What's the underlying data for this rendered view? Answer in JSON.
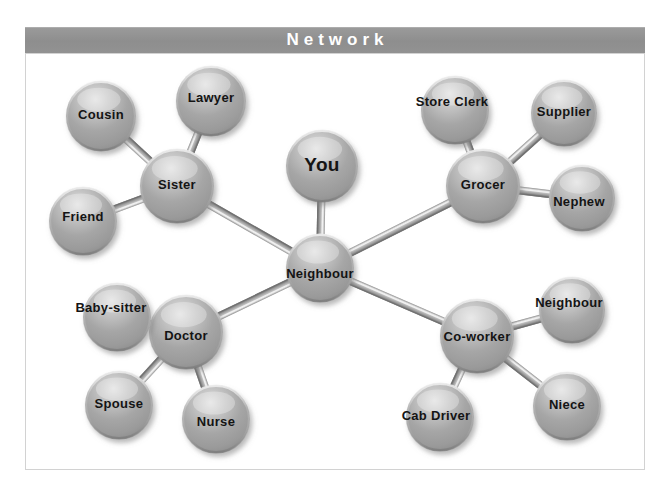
{
  "title": {
    "text": "Network"
  },
  "colors": {
    "title_band": "#919191",
    "title_text": "#ffffff",
    "frame_border": "#d2d2d2",
    "page_background": "#ffffff",
    "node_fill": "#a2a2a2",
    "node_highlight": "#d8d8d8",
    "node_shadow": "#6d6d6d",
    "node_label": "#141414",
    "edge_light": "#cfcfcf",
    "edge_dark": "#8a8a8a"
  },
  "chart_data": {
    "type": "diagram",
    "title": "Network",
    "layout": "node-link graph",
    "nodes": [
      {
        "id": "you",
        "label": "You",
        "x": 322,
        "y": 166,
        "r": 36,
        "font": 19,
        "label_dx": 0,
        "label_dy": 0
      },
      {
        "id": "neighbour_hub",
        "label": "Neighbour",
        "x": 320,
        "y": 268,
        "r": 34,
        "font": 13,
        "label_dx": 0,
        "label_dy": 7
      },
      {
        "id": "sister",
        "label": "Sister",
        "x": 177,
        "y": 186,
        "r": 37,
        "font": 13,
        "label_dx": 0,
        "label_dy": 0
      },
      {
        "id": "grocer",
        "label": "Grocer",
        "x": 483,
        "y": 186,
        "r": 37,
        "font": 13,
        "label_dx": 0,
        "label_dy": 0
      },
      {
        "id": "doctor",
        "label": "Doctor",
        "x": 186,
        "y": 332,
        "r": 37,
        "font": 13,
        "label_dx": 0,
        "label_dy": 5
      },
      {
        "id": "co_worker",
        "label": "Co-worker",
        "x": 477,
        "y": 336,
        "r": 37,
        "font": 13,
        "label_dx": 0,
        "label_dy": 2
      },
      {
        "id": "cousin",
        "label": "Cousin",
        "x": 101,
        "y": 116,
        "r": 35,
        "font": 13,
        "label_dx": 0,
        "label_dy": 0
      },
      {
        "id": "lawyer",
        "label": "Lawyer",
        "x": 211,
        "y": 101,
        "r": 35,
        "font": 13,
        "label_dx": 0,
        "label_dy": -2
      },
      {
        "id": "friend",
        "label": "Friend",
        "x": 83,
        "y": 221,
        "r": 34,
        "font": 13,
        "label_dx": 0,
        "label_dy": -3
      },
      {
        "id": "store_clerk",
        "label": "Store Clerk",
        "x": 455,
        "y": 110,
        "r": 34,
        "font": 13,
        "label_dx": -3,
        "label_dy": -7
      },
      {
        "id": "supplier",
        "label": "Supplier",
        "x": 564,
        "y": 113,
        "r": 33,
        "font": 13,
        "label_dx": 0,
        "label_dy": 0
      },
      {
        "id": "nephew",
        "label": "Nephew",
        "x": 582,
        "y": 198,
        "r": 33,
        "font": 13,
        "label_dx": -3,
        "label_dy": 5
      },
      {
        "id": "baby_sitter",
        "label": "Baby-sitter",
        "x": 117,
        "y": 317,
        "r": 34,
        "font": 13,
        "label_dx": -6,
        "label_dy": -8
      },
      {
        "id": "spouse",
        "label": "Spouse",
        "x": 119,
        "y": 405,
        "r": 34,
        "font": 13,
        "label_dx": 0,
        "label_dy": 0
      },
      {
        "id": "nurse",
        "label": "Nurse",
        "x": 216,
        "y": 419,
        "r": 34,
        "font": 13,
        "label_dx": 0,
        "label_dy": 4
      },
      {
        "id": "neighbour_2",
        "label": "Neighbour",
        "x": 572,
        "y": 310,
        "r": 33,
        "font": 13,
        "label_dx": -3,
        "label_dy": -6
      },
      {
        "id": "cab_driver",
        "label": "Cab Driver",
        "x": 440,
        "y": 417,
        "r": 34,
        "font": 13,
        "label_dx": -4,
        "label_dy": 0
      },
      {
        "id": "niece",
        "label": "Niece",
        "x": 567,
        "y": 406,
        "r": 34,
        "font": 13,
        "label_dx": 0,
        "label_dy": 0
      }
    ],
    "edges": [
      {
        "from": "you",
        "to": "neighbour_hub"
      },
      {
        "from": "neighbour_hub",
        "to": "sister"
      },
      {
        "from": "neighbour_hub",
        "to": "grocer"
      },
      {
        "from": "neighbour_hub",
        "to": "doctor"
      },
      {
        "from": "neighbour_hub",
        "to": "co_worker"
      },
      {
        "from": "sister",
        "to": "cousin"
      },
      {
        "from": "sister",
        "to": "lawyer"
      },
      {
        "from": "sister",
        "to": "friend"
      },
      {
        "from": "grocer",
        "to": "store_clerk"
      },
      {
        "from": "grocer",
        "to": "supplier"
      },
      {
        "from": "grocer",
        "to": "nephew"
      },
      {
        "from": "doctor",
        "to": "baby_sitter"
      },
      {
        "from": "doctor",
        "to": "spouse"
      },
      {
        "from": "doctor",
        "to": "nurse"
      },
      {
        "from": "co_worker",
        "to": "neighbour_2"
      },
      {
        "from": "co_worker",
        "to": "cab_driver"
      },
      {
        "from": "co_worker",
        "to": "niece"
      }
    ]
  }
}
